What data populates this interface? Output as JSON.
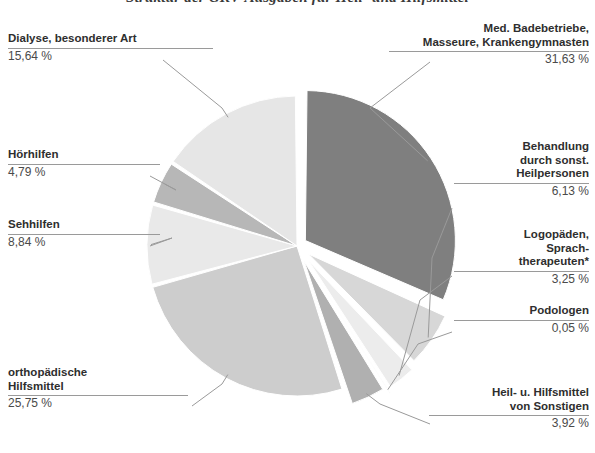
{
  "title": "Struktur der GKV-Ausgaben für Heil- und Hilfsmittel",
  "chart_data": {
    "type": "pie",
    "title": "Struktur der GKV-Ausgaben für Heil- und Hilfsmittel",
    "xlabel": "",
    "ylabel": "",
    "legend_position": "callout-labels",
    "grid": false,
    "unit": "%",
    "footnote_marker": "*",
    "categories": [
      "Med. Badebetriebe,\nMasseure, Krankengymnasten",
      "Behandlung\ndurch sonst.\nHeilpersonen",
      "Logopäden,\nSprach-\ntherapeuten*",
      "Podologen",
      "Heil- u. Hilfsmittel\nvon Sonstigen",
      "orthopädische\nHilfsmittel",
      "Sehhilfen",
      "Hörhilfen",
      "Dialyse, besonderer Art"
    ],
    "values": [
      31.63,
      6.13,
      3.25,
      0.05,
      3.92,
      25.75,
      8.84,
      4.79,
      15.64
    ],
    "value_labels": [
      "31,63 %",
      "6,13 %",
      "3,25 %",
      "0,05 %",
      "3,92 %",
      "25,75 %",
      "8,84 %",
      "4,79 %",
      "15,64 %"
    ],
    "colors": [
      "#7f7f7f",
      "#d7d7d7",
      "#ececec",
      "#f2f2f2",
      "#b0b0b0",
      "#cdcdcd",
      "#e9e9e9",
      "#b7b7b7",
      "#e6e6e6"
    ]
  },
  "slices": {
    "badebetriebe": {
      "name": "Med. Badebetriebe,\nMasseure, Krankengymnasten",
      "pct": "31,63 %"
    },
    "behandlung": {
      "name": "Behandlung\ndurch sonst.\nHeilpersonen",
      "pct": "6,13 %"
    },
    "logopaeden": {
      "name": "Logopäden,\nSprach-\ntherapeuten*",
      "pct": "3,25 %"
    },
    "podologen": {
      "name": "Podologen",
      "pct": "0,05 %"
    },
    "sonstige": {
      "name": "Heil- u. Hilfsmittel\nvon Sonstigen",
      "pct": "3,92 %"
    },
    "orthopaedisch": {
      "name": "orthopädische\nHilfsmittel",
      "pct": "25,75 %"
    },
    "sehhilfen": {
      "name": "Sehhilfen",
      "pct": "8,84 %"
    },
    "hoerhilfen": {
      "name": "Hörhilfen",
      "pct": "4,79 %"
    },
    "dialyse": {
      "name": "Dialyse, besonderer Art",
      "pct": "15,64 %"
    }
  }
}
